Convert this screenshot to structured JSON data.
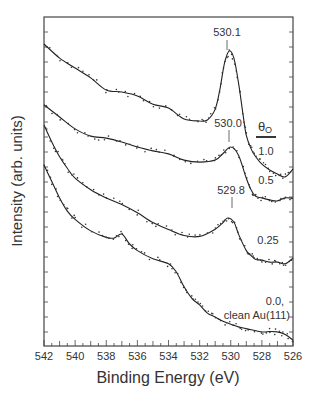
{
  "chart_data": {
    "type": "line",
    "title": "",
    "xlabel": "Binding Energy (eV)",
    "ylabel": "Intensity (arb. units)",
    "xlim": [
      542,
      526
    ],
    "x_reversed": true,
    "ylim": [
      0,
      100
    ],
    "xticks": [
      542,
      540,
      538,
      536,
      534,
      532,
      530,
      528,
      526
    ],
    "grid": false,
    "legend_title": "θO",
    "series": [
      {
        "name": "1.0",
        "label_xy": [
          530.1,
          530.1
        ],
        "peak_label": "530.1",
        "peak_energy": 530.1,
        "x": [
          542,
          541,
          540,
          539,
          538,
          537,
          536,
          535,
          534,
          533,
          532,
          531.5,
          531,
          530.7,
          530.4,
          530.1,
          529.8,
          529.5,
          529.2,
          529,
          528.7,
          528.4,
          528,
          527.5,
          527,
          526.5,
          526
        ],
        "y": [
          91.8,
          87.5,
          84.5,
          81.5,
          77.8,
          77.2,
          76.0,
          73.5,
          72.3,
          69.0,
          68.4,
          68.7,
          72.0,
          78.0,
          86.0,
          89.7,
          87.5,
          80.0,
          70.0,
          64.0,
          60.0,
          57.5,
          55.3,
          53.5,
          52.3,
          51.4,
          53.8
        ]
      },
      {
        "name": "0.5",
        "peak_label": "530.0",
        "peak_energy": 530.0,
        "x": [
          542,
          541,
          540,
          539,
          538,
          537,
          536,
          535,
          534,
          533,
          532,
          531,
          530.5,
          530.0,
          529.5,
          529,
          528.7,
          528.4,
          528,
          527.5,
          527,
          526.5,
          526
        ],
        "y": [
          73.3,
          69.6,
          66.0,
          63.8,
          63.2,
          62.0,
          60.5,
          59.3,
          58.4,
          56.5,
          55.9,
          56.5,
          58.5,
          60.5,
          58.0,
          51.0,
          47.5,
          45.5,
          45.0,
          44.4,
          44.1,
          45.0,
          44.9
        ]
      },
      {
        "name": "0.25",
        "peak_label": "529.8",
        "peak_energy": 529.8,
        "x": [
          542,
          541.5,
          541,
          540.5,
          540,
          539,
          538,
          537,
          536,
          535,
          534,
          533,
          532,
          531,
          530.5,
          530.2,
          529.8,
          529.5,
          529,
          528.7,
          528.4,
          528,
          527.5,
          527,
          526.5,
          526
        ],
        "y": [
          67.2,
          62.0,
          57.5,
          54.0,
          51.0,
          47.5,
          45.0,
          43.0,
          40.5,
          37.5,
          35.4,
          33.6,
          33.3,
          35.5,
          37.5,
          38.9,
          37.7,
          34.0,
          29.0,
          27.5,
          26.3,
          26.1,
          25.5,
          25.5,
          25.0,
          26.7
        ]
      },
      {
        "name": "0.0, clean Au(111)",
        "x": [
          542,
          541.5,
          541,
          540.5,
          540,
          539,
          538,
          537.5,
          537,
          536.5,
          536,
          535,
          534,
          533.5,
          533,
          532.5,
          532,
          531.5,
          531,
          530.5,
          530,
          529.5,
          529,
          528,
          527.5,
          527,
          526.5,
          526
        ],
        "y": [
          55.0,
          50.0,
          45.0,
          41.0,
          38.5,
          35.0,
          33.0,
          32.8,
          34.0,
          31.0,
          29.0,
          26.5,
          25.0,
          22.5,
          18.0,
          14.5,
          12.5,
          10.0,
          8.8,
          7.5,
          6.6,
          5.8,
          5.3,
          4.3,
          4.4,
          4.3,
          3.5,
          1.8
        ]
      }
    ],
    "annotations": [
      {
        "text": "530.1",
        "energy": 530.1
      },
      {
        "text": "530.0",
        "energy": 530.0
      },
      {
        "text": "529.8",
        "energy": 529.8
      },
      {
        "text": "1.0"
      },
      {
        "text": "0.5"
      },
      {
        "text": "0.25"
      },
      {
        "text": "0.0,"
      },
      {
        "text": "clean Au(111)"
      }
    ]
  },
  "labels": {
    "xlabel": "Binding Energy (eV)",
    "ylabel": "Intensity (arb. units)",
    "legend_title": "θ",
    "legend_sub": "O",
    "peak1": "530.1",
    "peak2": "530.0",
    "peak3": "529.8",
    "cov1": "1.0",
    "cov2": "0.5",
    "cov3": "0.25",
    "cov4a": "0.0,",
    "cov4b": "clean Au(111)",
    "xticks": [
      "542",
      "540",
      "538",
      "536",
      "534",
      "532",
      "530",
      "528",
      "526"
    ]
  }
}
